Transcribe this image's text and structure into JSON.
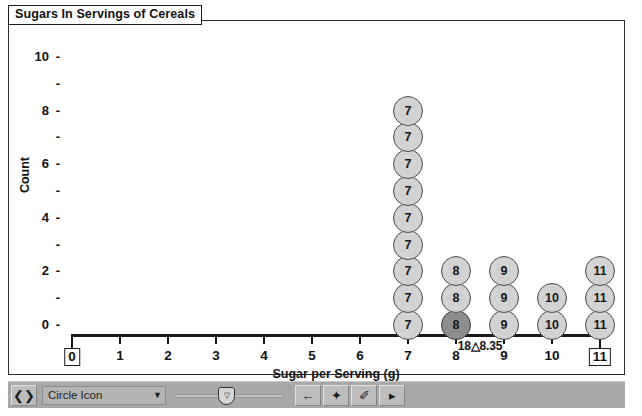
{
  "window": {
    "title": "Sugars In Servings of Cereals"
  },
  "chart_data": {
    "type": "dotplot",
    "title": "Sugars In Servings of Cereals",
    "xlabel": "Sugar per Serving (g)",
    "ylabel": "Count",
    "xlim": [
      0,
      11
    ],
    "ylim": [
      0,
      10
    ],
    "x_ticks": [
      0,
      1,
      2,
      3,
      4,
      5,
      6,
      7,
      8,
      9,
      10,
      11
    ],
    "x_tick_labels": [
      "0",
      "1",
      "2",
      "3",
      "4",
      "5",
      "6",
      "7",
      "8",
      "9",
      "10",
      "11"
    ],
    "x_boxed_ticks": [
      "0",
      "11"
    ],
    "y_major_ticks": [
      0,
      2,
      4,
      6,
      8,
      10
    ],
    "y_minor_ticks": [
      1,
      3,
      5,
      7,
      9
    ],
    "grid": false,
    "legend": "none",
    "categories": [
      7,
      8,
      9,
      10,
      11
    ],
    "values": [
      9,
      3,
      3,
      2,
      3
    ],
    "dot_label_mode": "value",
    "selected_point": {
      "x": 8,
      "index": 1
    },
    "annotation": {
      "text": "18△8.35",
      "prefix": "18",
      "marker": "△",
      "mean": "8.35",
      "x_position": 8.5
    },
    "colors": {
      "dot_fill": "#d2d2d2",
      "dot_border": "#4a4a4a",
      "dot_selected_fill": "#8e8e8e",
      "axis": "#1a1a1a",
      "text": "#111111",
      "background": "#ffffff",
      "toolbar": "#a8a8a8"
    }
  },
  "toolbar": {
    "drag_handle_label": "❮❯",
    "icon_select": {
      "value": "Circle Icon",
      "caret": "▼"
    },
    "slider": {
      "thumb_label": "▽"
    },
    "buttons": [
      {
        "name": "back-button",
        "label": "←"
      },
      {
        "name": "add-point-button",
        "label": "✦"
      },
      {
        "name": "pen-button",
        "label": "✐"
      },
      {
        "name": "play-button",
        "label": "▸"
      }
    ]
  }
}
